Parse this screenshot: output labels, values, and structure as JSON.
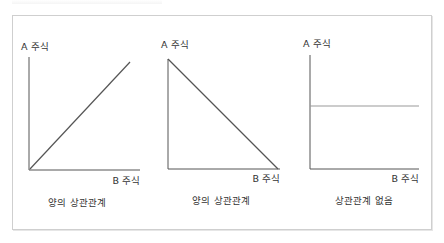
{
  "figure": {
    "panels": [
      {
        "y_label": "A 주식",
        "x_label": "B 주식",
        "caption": "양의 상관관계",
        "line": "increasing"
      },
      {
        "y_label": "A 주식",
        "x_label": "B 주식",
        "caption": "양의 상관관계",
        "line": "decreasing"
      },
      {
        "y_label": "A 주식",
        "x_label": "B 주식",
        "caption": "상관관계 없음",
        "line": "flat"
      }
    ],
    "colors": {
      "axis": "#555555",
      "line": "#555555",
      "flat_line": "#9a9a9a",
      "frame": "#cfcfcf"
    }
  }
}
